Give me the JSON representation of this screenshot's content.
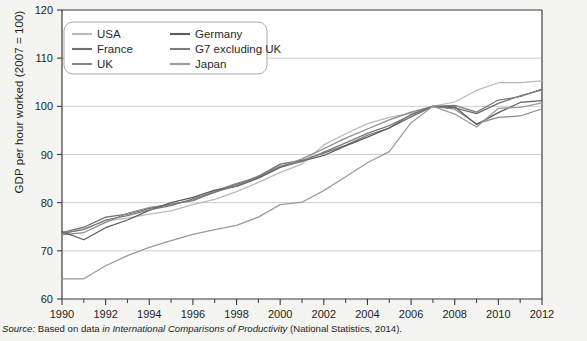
{
  "figure": {
    "ylabel": "GDP per hour worked (2007 = 100)",
    "source_prefix": "Source:",
    "source_text_1": "Based on data",
    "source_in": "in",
    "source_title": "International Comparisons of Productivity",
    "source_text_2": "(National Statistics, 2014)."
  },
  "legend": {
    "items": [
      {
        "label": "USA",
        "color": "#b9b9b6"
      },
      {
        "label": "France",
        "color": "#6e6e6b"
      },
      {
        "label": "UK",
        "color": "#8a8a87"
      },
      {
        "label": "Germany",
        "color": "#5c5c59"
      },
      {
        "label": "G7 excluding UK",
        "color": "#7a7a77"
      },
      {
        "label": "Japan",
        "color": "#9a9a97"
      }
    ]
  },
  "chart_data": {
    "type": "line",
    "title": "",
    "xlabel": "",
    "ylabel": "GDP per hour worked (2007 = 100)",
    "xlim": [
      1990,
      2012
    ],
    "ylim": [
      60,
      120
    ],
    "yticks": [
      60,
      70,
      80,
      90,
      100,
      110,
      120
    ],
    "xticks": [
      1990,
      1992,
      1994,
      1996,
      1998,
      2000,
      2002,
      2004,
      2006,
      2008,
      2010,
      2012
    ],
    "xminor": [
      1991,
      1993,
      1995,
      1997,
      1999,
      2001,
      2003,
      2005,
      2007,
      2009,
      2011
    ],
    "grid": "horizontal",
    "legend_position": "top-left",
    "x": [
      1990,
      1991,
      1992,
      1993,
      1994,
      1995,
      1996,
      1997,
      1998,
      1999,
      2000,
      2001,
      2002,
      2003,
      2004,
      2005,
      2006,
      2007,
      2008,
      2009,
      2010,
      2011,
      2012
    ],
    "series": [
      {
        "name": "USA",
        "color": "#b9b9b6",
        "values": [
          73.5,
          74.6,
          76.2,
          76.8,
          77.6,
          78.3,
          79.6,
          80.7,
          82.3,
          84.2,
          86.3,
          88.0,
          92.0,
          94.3,
          96.4,
          97.7,
          98.6,
          100.0,
          100.9,
          103.3,
          104.9,
          104.9,
          105.3
        ]
      },
      {
        "name": "France",
        "color": "#6e6e6b",
        "values": [
          73.8,
          74.9,
          77.0,
          77.6,
          78.8,
          79.7,
          80.4,
          82.2,
          83.8,
          85.5,
          88.0,
          88.8,
          90.3,
          91.9,
          94.0,
          95.5,
          97.8,
          100.0,
          99.7,
          98.5,
          100.6,
          102.2,
          103.4
        ]
      },
      {
        "name": "UK",
        "color": "#8a8a87",
        "values": [
          73.3,
          73.8,
          75.9,
          77.8,
          79.0,
          79.6,
          80.6,
          82.4,
          84.0,
          85.2,
          87.4,
          89.1,
          91.2,
          93.4,
          95.3,
          97.2,
          98.8,
          100.0,
          99.4,
          96.4,
          97.7,
          98.0,
          99.5
        ]
      },
      {
        "name": "Germany",
        "color": "#5c5c59",
        "values": [
          74.0,
          72.3,
          74.8,
          76.4,
          78.4,
          80.0,
          81.1,
          82.6,
          83.4,
          85.1,
          87.3,
          88.6,
          89.8,
          91.8,
          93.6,
          95.5,
          98.3,
          100.0,
          99.9,
          96.2,
          98.7,
          100.8,
          101.2
        ]
      },
      {
        "name": "G7 excluding UK",
        "color": "#7a7a77",
        "values": [
          73.6,
          74.4,
          76.4,
          77.3,
          78.5,
          79.4,
          80.8,
          82.2,
          83.5,
          85.4,
          87.6,
          88.5,
          90.5,
          92.4,
          94.4,
          96.0,
          98.2,
          100.0,
          100.2,
          98.8,
          101.3,
          102.0,
          103.6
        ]
      },
      {
        "name": "Japan",
        "color": "#9a9a97",
        "values": [
          64.2,
          64.2,
          66.9,
          69.0,
          70.7,
          72.1,
          73.4,
          74.4,
          75.3,
          77.0,
          79.6,
          80.1,
          82.5,
          85.4,
          88.3,
          90.6,
          96.6,
          100.0,
          98.4,
          95.7,
          99.6,
          99.8,
          100.7
        ]
      }
    ]
  }
}
